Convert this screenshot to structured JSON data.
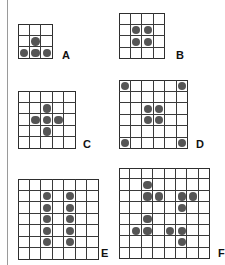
{
  "colors": {
    "grid_line": "#2e2e2e",
    "dot": "#555555",
    "label": "#111111",
    "divider": "#9a9a9a"
  },
  "puzzles": [
    {
      "label": "A",
      "size": 3,
      "x": 18,
      "y": 24,
      "cell": 11.7,
      "label_x": 62,
      "label_y": 50,
      "dots": [
        [
          1,
          1
        ],
        [
          2,
          0
        ],
        [
          2,
          1
        ],
        [
          2,
          2
        ]
      ]
    },
    {
      "label": "B",
      "size": 4,
      "x": 119,
      "y": 13,
      "cell": 11.5,
      "label_x": 176,
      "label_y": 50,
      "dots": [
        [
          1,
          1
        ],
        [
          1,
          2
        ],
        [
          2,
          1
        ],
        [
          2,
          2
        ]
      ]
    },
    {
      "label": "C",
      "size": 5,
      "x": 18,
      "y": 91,
      "cell": 11.6,
      "label_x": 83,
      "label_y": 139,
      "dots": [
        [
          1,
          2
        ],
        [
          2,
          1
        ],
        [
          2,
          2
        ],
        [
          2,
          3
        ],
        [
          3,
          2
        ]
      ]
    },
    {
      "label": "D",
      "size": 6,
      "x": 119,
      "y": 80,
      "cell": 11.5,
      "label_x": 196,
      "label_y": 139,
      "dots": [
        [
          0,
          0
        ],
        [
          0,
          5
        ],
        [
          2,
          2
        ],
        [
          2,
          3
        ],
        [
          3,
          2
        ],
        [
          3,
          3
        ],
        [
          5,
          0
        ],
        [
          5,
          5
        ]
      ]
    },
    {
      "label": "E",
      "size": 7,
      "x": 18,
      "y": 179,
      "cell": 11.5,
      "label_x": 101,
      "label_y": 248,
      "dots": [
        [
          1,
          2
        ],
        [
          1,
          4
        ],
        [
          2,
          2
        ],
        [
          2,
          4
        ],
        [
          3,
          2
        ],
        [
          3,
          4
        ],
        [
          4,
          2
        ],
        [
          4,
          4
        ],
        [
          5,
          2
        ],
        [
          5,
          4
        ]
      ]
    },
    {
      "label": "F",
      "size": 8,
      "x": 119,
      "y": 168,
      "cell": 11.4,
      "label_x": 218,
      "label_y": 248,
      "dots": [
        [
          1,
          2
        ],
        [
          2,
          2
        ],
        [
          2,
          3
        ],
        [
          2,
          5
        ],
        [
          2,
          6
        ],
        [
          3,
          5
        ],
        [
          4,
          2
        ],
        [
          5,
          1
        ],
        [
          5,
          2
        ],
        [
          5,
          4
        ],
        [
          5,
          5
        ],
        [
          6,
          5
        ]
      ]
    }
  ]
}
